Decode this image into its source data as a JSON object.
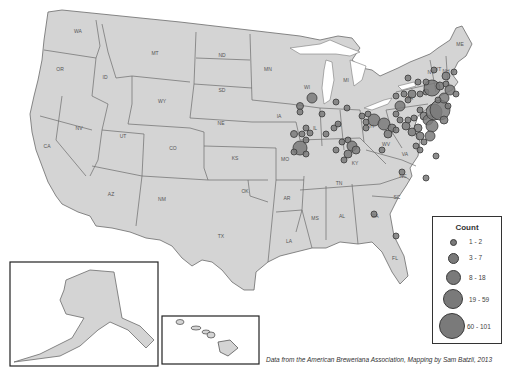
{
  "map": {
    "title": "US breweriana locations (count by location)",
    "base_color": "#d4d4d4",
    "border_color": "#6b6b6b",
    "bubble_color": "#7a7a7a",
    "state_labels": [
      {
        "abbr": "WA",
        "x": 78,
        "y": 33
      },
      {
        "abbr": "OR",
        "x": 60,
        "y": 71
      },
      {
        "abbr": "ID",
        "x": 105,
        "y": 79
      },
      {
        "abbr": "MT",
        "x": 155,
        "y": 55
      },
      {
        "abbr": "ND",
        "x": 222,
        "y": 57
      },
      {
        "abbr": "SD",
        "x": 222,
        "y": 92
      },
      {
        "abbr": "MN",
        "x": 268,
        "y": 71
      },
      {
        "abbr": "WY",
        "x": 162,
        "y": 103
      },
      {
        "abbr": "NE",
        "x": 221,
        "y": 125
      },
      {
        "abbr": "NV",
        "x": 79,
        "y": 130
      },
      {
        "abbr": "UT",
        "x": 123,
        "y": 138
      },
      {
        "abbr": "CO",
        "x": 173,
        "y": 150
      },
      {
        "abbr": "CA",
        "x": 47,
        "y": 148
      },
      {
        "abbr": "KS",
        "x": 235,
        "y": 160
      },
      {
        "abbr": "IA",
        "x": 279,
        "y": 118
      },
      {
        "abbr": "WI",
        "x": 307,
        "y": 89
      },
      {
        "abbr": "MI",
        "x": 346,
        "y": 82
      },
      {
        "abbr": "MO",
        "x": 285,
        "y": 161
      },
      {
        "abbr": "AZ",
        "x": 111,
        "y": 196
      },
      {
        "abbr": "NM",
        "x": 162,
        "y": 201
      },
      {
        "abbr": "OK",
        "x": 245,
        "y": 193
      },
      {
        "abbr": "TX",
        "x": 221,
        "y": 238
      },
      {
        "abbr": "AR",
        "x": 287,
        "y": 200
      },
      {
        "abbr": "LA",
        "x": 289,
        "y": 243
      },
      {
        "abbr": "MS",
        "x": 315,
        "y": 220
      },
      {
        "abbr": "AL",
        "x": 342,
        "y": 218
      },
      {
        "abbr": "TN",
        "x": 339,
        "y": 185
      },
      {
        "abbr": "KY",
        "x": 355,
        "y": 165
      },
      {
        "abbr": "OH",
        "x": 370,
        "y": 128
      },
      {
        "abbr": "WV",
        "x": 386,
        "y": 146
      },
      {
        "abbr": "VA",
        "x": 405,
        "y": 156
      },
      {
        "abbr": "NC",
        "x": 403,
        "y": 178
      },
      {
        "abbr": "SC",
        "x": 397,
        "y": 199
      },
      {
        "abbr": "GA",
        "x": 375,
        "y": 218
      },
      {
        "abbr": "FL",
        "x": 395,
        "y": 260
      },
      {
        "abbr": "PA",
        "x": 410,
        "y": 100
      },
      {
        "abbr": "NY",
        "x": 431,
        "y": 74
      },
      {
        "abbr": "VT",
        "x": 438,
        "y": 71
      },
      {
        "abbr": "NH",
        "x": 446,
        "y": 73
      },
      {
        "abbr": "ME",
        "x": 460,
        "y": 46
      },
      {
        "abbr": "IN",
        "x": 338,
        "y": 127
      },
      {
        "abbr": "IL",
        "x": 315,
        "y": 130
      },
      {
        "abbr": "AK",
        "x": 96,
        "y": 305
      },
      {
        "abbr": "HI",
        "x": 222,
        "y": 353
      }
    ]
  },
  "legend": {
    "title": "Count",
    "items": [
      {
        "label": "1 - 2",
        "size": 5
      },
      {
        "label": "3 - 7",
        "size": 9
      },
      {
        "label": "8 - 18",
        "size": 14
      },
      {
        "label": "19 - 59",
        "size": 19
      },
      {
        "label": "60 - 101",
        "size": 26
      }
    ]
  },
  "credit": "Data from the American Breweriana Association, Mapping by Sam Batzli, 2013",
  "chart_data": {
    "type": "scatter",
    "title": "",
    "subtitle": "Proportional symbol map of breweriana locations in the contiguous US",
    "legend_title": "Count",
    "legend_bins": [
      "1 - 2",
      "3 - 7",
      "8 - 18",
      "19 - 59",
      "60 - 101"
    ],
    "legend_position": "bottom-right",
    "regions_with_points": [
      "WI",
      "IL",
      "IA",
      "MO",
      "IN",
      "MI",
      "OH",
      "KY",
      "WV",
      "PA",
      "NY",
      "NJ",
      "MD",
      "DE",
      "VA",
      "NC",
      "GA",
      "FL",
      "MA",
      "CT",
      "RI",
      "NH",
      "VT"
    ],
    "notable_largest_clusters": [
      {
        "area": "Philadelphia/PA-NJ",
        "bin": "60 - 101"
      },
      {
        "area": "New York City",
        "bin": "60 - 101"
      },
      {
        "area": "Albany/Hudson NY",
        "bin": "19 - 59"
      },
      {
        "area": "St. Louis MO",
        "bin": "19 - 59"
      },
      {
        "area": "Milwaukee WI",
        "bin": "8 - 18"
      },
      {
        "area": "Cincinnati/Louisville",
        "bin": "8 - 18"
      },
      {
        "area": "Buffalo/Cleveland",
        "bin": "8 - 18"
      }
    ],
    "insets": [
      "Alaska (AK)",
      "Hawaii (HI)"
    ]
  }
}
